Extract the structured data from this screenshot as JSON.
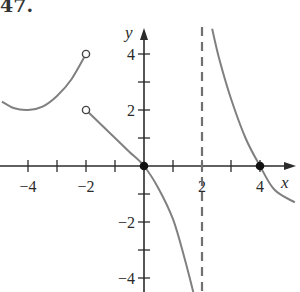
{
  "problem_number": "47.",
  "chart_data": {
    "type": "line",
    "title": "",
    "xlabel": "x",
    "ylabel": "y",
    "xlim": [
      -5,
      5
    ],
    "ylim": [
      -4.5,
      4.9
    ],
    "grid": false,
    "x_ticks": [
      -4,
      -3,
      -2,
      -1,
      0,
      1,
      2,
      3,
      4
    ],
    "x_tick_labels": [
      "-4",
      "",
      "-2",
      "",
      "",
      "",
      "2",
      "",
      "4"
    ],
    "y_ticks": [
      -4,
      -3,
      -2,
      -1,
      0,
      1,
      2,
      3,
      4
    ],
    "y_tick_labels": [
      "-4",
      "",
      "-2",
      "",
      "",
      "",
      "2",
      "",
      "4"
    ],
    "asymptotes": [
      {
        "type": "vertical",
        "x": 2,
        "style": "dashed"
      }
    ],
    "series": [
      {
        "name": "left-branch",
        "description": "curve on x < -2, minimum near (-4, 2), rising to open circle at (-2, 4)",
        "points": [
          [
            -4.9,
            2.3
          ],
          [
            -4.5,
            2.07
          ],
          [
            -4.0,
            2.0
          ],
          [
            -3.5,
            2.12
          ],
          [
            -3.0,
            2.5
          ],
          [
            -2.5,
            3.1
          ],
          [
            -2.0,
            4.0
          ]
        ],
        "endpoints": [
          {
            "x": -2,
            "y": 4,
            "open": true
          }
        ]
      },
      {
        "name": "middle-branch",
        "description": "starts at open circle (-2, 2), passes through (0, 0), descends toward -infinity as x -> 2-",
        "points": [
          [
            -2.0,
            2.0
          ],
          [
            -1.5,
            1.5
          ],
          [
            -1.0,
            1.0
          ],
          [
            -0.5,
            0.5
          ],
          [
            0.0,
            0.0
          ],
          [
            0.5,
            -0.8
          ],
          [
            1.0,
            -1.9
          ],
          [
            1.4,
            -3.3
          ],
          [
            1.7,
            -4.5
          ]
        ],
        "endpoints": [
          {
            "x": -2,
            "y": 2,
            "open": true
          },
          {
            "x": 0,
            "y": 0,
            "open": false
          }
        ]
      },
      {
        "name": "right-branch",
        "description": "descends from +infinity as x -> 2+, crosses x-axis at (4, 0)",
        "points": [
          [
            2.35,
            4.9
          ],
          [
            2.6,
            3.8
          ],
          [
            3.0,
            2.4
          ],
          [
            3.5,
            1.0
          ],
          [
            4.0,
            0.0
          ],
          [
            4.5,
            -0.85
          ],
          [
            5.2,
            -1.3
          ]
        ],
        "endpoints": [
          {
            "x": 4,
            "y": 0,
            "open": false
          }
        ]
      }
    ]
  }
}
